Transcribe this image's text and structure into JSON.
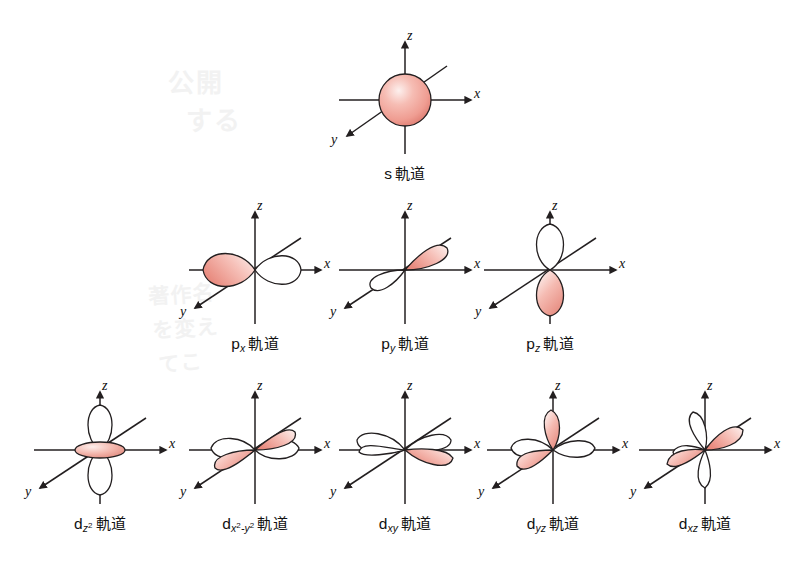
{
  "figure": {
    "title": "",
    "background": "#ffffff",
    "colors": {
      "lobe_fill_light": "#fbe6e2",
      "lobe_fill_mid": "#f3a9a0",
      "lobe_fill_dark": "#e08278",
      "lobe_outline": "#231f20",
      "empty_lobe_fill": "#ffffff",
      "axis_line": "#231f20",
      "text": "#111111",
      "watermark": "#f2f2f2"
    },
    "axes": {
      "z_label": "z",
      "x_label": "x",
      "y_label": "y"
    },
    "suffix": "軌道",
    "watermark_lines": [
      "公開",
      "する",
      "著作名",
      "を変え",
      "てこ"
    ]
  },
  "orbitals": [
    {
      "id": "s",
      "row": 0,
      "symbol": "s",
      "sub": "",
      "sup": "",
      "label": "s 軌道",
      "shape": "sphere",
      "description": "spherical s orbital, filled pink"
    },
    {
      "id": "px",
      "row": 1,
      "symbol": "p",
      "sub": "x",
      "sup": "",
      "label": "p_x 軌道",
      "shape": "dumbbell-x",
      "description": "two lobes along x axis; left lobe filled pink, right lobe white"
    },
    {
      "id": "py",
      "row": 1,
      "symbol": "p",
      "sub": "y",
      "sup": "",
      "label": "p_y 軌道",
      "shape": "dumbbell-y",
      "description": "two lobes along y axis; upper-right lobe filled pink, lower-left white"
    },
    {
      "id": "pz",
      "row": 1,
      "symbol": "p",
      "sub": "z",
      "sup": "",
      "label": "p_z 軌道",
      "shape": "dumbbell-z",
      "description": "two lobes along z axis; lower lobe filled pink, upper lobe white"
    },
    {
      "id": "dz2",
      "row": 2,
      "symbol": "d",
      "sub": "z",
      "sup": "2",
      "label": "d_z2 軌道",
      "shape": "dz2",
      "description": "two white lobes along z with pink torus ring at centre"
    },
    {
      "id": "dx2y2",
      "row": 2,
      "symbol": "d",
      "sub": "x2-y2",
      "sup": "",
      "label": "d_x2-y2 軌道",
      "shape": "dx2y2",
      "description": "four lobes along x and y axes; y-axis pair pink, x-axis pair white"
    },
    {
      "id": "dxy",
      "row": 2,
      "symbol": "d",
      "sub": "xy",
      "sup": "",
      "label": "d_xy 軌道",
      "shape": "dxy",
      "description": "four lobes between x and y axes; right lobe pink"
    },
    {
      "id": "dyz",
      "row": 2,
      "symbol": "d",
      "sub": "yz",
      "sup": "",
      "label": "d_yz 軌道",
      "shape": "dyz",
      "description": "four lobes between y and z axes; two pink lobes tilted"
    },
    {
      "id": "dxz",
      "row": 2,
      "symbol": "d",
      "sub": "xz",
      "sup": "",
      "label": "d_xz 軌道",
      "shape": "dxz",
      "description": "four lobes between x and z axes; upper-right and lower-left pink"
    }
  ],
  "labels": {
    "s": {
      "sym": "s",
      "sub": "",
      "sup": "",
      "jp": "軌道"
    },
    "px": {
      "sym": "p",
      "sub": "x",
      "sup": "",
      "jp": "軌道"
    },
    "py": {
      "sym": "p",
      "sub": "y",
      "sup": "",
      "jp": "軌道"
    },
    "pz": {
      "sym": "p",
      "sub": "z",
      "sup": "",
      "jp": "軌道"
    },
    "dz2": {
      "sym": "d",
      "sub": "z",
      "sup": "2",
      "jp": "軌道"
    },
    "dx2y2": {
      "sym": "d",
      "sub": "x",
      "sup": "2",
      "jp": "軌道"
    },
    "dxy": {
      "sym": "d",
      "sub": "xy",
      "sup": "",
      "jp": "軌道"
    },
    "dyz": {
      "sym": "d",
      "sub": "yz",
      "sup": "",
      "jp": "軌道"
    },
    "dxz": {
      "sym": "d",
      "sub": "xz",
      "sup": "",
      "jp": "軌道"
    }
  }
}
